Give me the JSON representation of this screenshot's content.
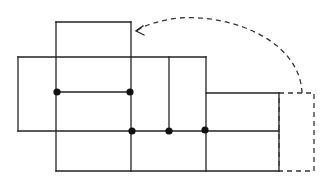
{
  "diagram": {
    "type": "unfolded-box-net",
    "colors": {
      "stroke": "#222222",
      "dash": "#333333",
      "dot": "#111111",
      "background": "#ffffff"
    },
    "solid_segments": [
      {
        "x1": 56,
        "y1": 22,
        "x2": 131,
        "y2": 22
      },
      {
        "x1": 18,
        "y1": 57,
        "x2": 206,
        "y2": 57
      },
      {
        "x1": 56,
        "y1": 92,
        "x2": 131,
        "y2": 92
      },
      {
        "x1": 206,
        "y1": 93,
        "x2": 279,
        "y2": 93
      },
      {
        "x1": 18,
        "y1": 131,
        "x2": 279,
        "y2": 131
      },
      {
        "x1": 56,
        "y1": 171,
        "x2": 279,
        "y2": 171
      },
      {
        "x1": 18,
        "y1": 57,
        "x2": 18,
        "y2": 131
      },
      {
        "x1": 56,
        "y1": 22,
        "x2": 56,
        "y2": 171
      },
      {
        "x1": 131,
        "y1": 22,
        "x2": 131,
        "y2": 171
      },
      {
        "x1": 169,
        "y1": 57,
        "x2": 169,
        "y2": 131
      },
      {
        "x1": 206,
        "y1": 57,
        "x2": 206,
        "y2": 171
      },
      {
        "x1": 279,
        "y1": 93,
        "x2": 279,
        "y2": 171
      }
    ],
    "dashed_flap": {
      "x": 279,
      "y": 93,
      "width": 35,
      "height": 78
    },
    "fold_arrow": {
      "path": "M 302 93 C 300 40, 230 14, 180 18 C 160 20, 145 25, 136 31",
      "arrowhead": "M 143 26 L 136 31 L 144 35"
    },
    "dots": [
      {
        "cx": 57,
        "cy": 92
      },
      {
        "cx": 130,
        "cy": 92
      },
      {
        "cx": 132,
        "cy": 131
      },
      {
        "cx": 169,
        "cy": 131
      },
      {
        "cx": 205,
        "cy": 130
      }
    ],
    "dot_radius": 3.6
  }
}
